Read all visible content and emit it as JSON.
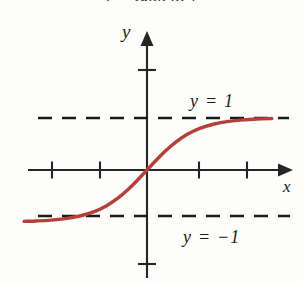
{
  "figure": {
    "background_color": "#fdfdfb",
    "axis_color": "#262626",
    "curve_color": "#b5403a",
    "dash_color": "#1a1a1a",
    "caption_cutoff_text": "y = tanh x,  y"
  },
  "axes": {
    "y_axis_label": "y",
    "x_axis_label": "x"
  },
  "asymptotes": {
    "upper_label": "y = 1",
    "lower_label": "y = −1"
  },
  "chart_data": {
    "type": "line",
    "title": "",
    "xlabel": "x",
    "ylabel": "y",
    "xlim": [
      -2.5,
      2.6
    ],
    "ylim": [
      -2.9,
      2.9
    ],
    "grid": false,
    "legend": null,
    "axis_arrows": [
      "x-positive",
      "y-positive"
    ],
    "origin_px": [
      147,
      170
    ],
    "x_unit_px": 48,
    "y_unit_px": 52,
    "xticks": [
      -2,
      -1,
      1,
      2
    ],
    "xtick_labels": [
      "",
      "",
      "",
      ""
    ],
    "yticks": [
      -1.8,
      1.9
    ],
    "ytick_labels": [
      "",
      ""
    ],
    "series": [
      {
        "name": "y = tanh x",
        "color": "#b5403a",
        "linewidth_px": 3.4,
        "x": [
          -2.56,
          -2.3,
          -2.0,
          -1.7,
          -1.4,
          -1.1,
          -0.85,
          -0.6,
          -0.4,
          -0.2,
          0.0,
          0.2,
          0.4,
          0.6,
          0.85,
          1.1,
          1.4,
          1.7,
          2.0,
          2.3,
          2.6
        ],
        "y": [
          -0.988,
          -0.98,
          -0.964,
          -0.935,
          -0.885,
          -0.8,
          -0.691,
          -0.537,
          -0.38,
          -0.197,
          0.0,
          0.197,
          0.38,
          0.537,
          0.691,
          0.8,
          0.885,
          0.935,
          0.964,
          0.98,
          0.989
        ]
      }
    ],
    "annotations": [
      {
        "text": "y = 1",
        "kind": "horizontal-asymptote-label",
        "y": 1.0,
        "x": 0.95
      },
      {
        "text": "y = −1",
        "kind": "horizontal-asymptote-label",
        "y": -1.0,
        "x": 0.82
      }
    ],
    "reference_lines": [
      {
        "name": "upper-asymptote",
        "y": 1.0,
        "style": "dashed",
        "color": "#1a1a1a"
      },
      {
        "name": "lower-asymptote",
        "y": -1.0,
        "style": "dashed",
        "color": "#1a1a1a"
      }
    ]
  }
}
